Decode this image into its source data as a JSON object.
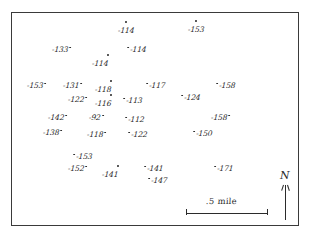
{
  "figure": {
    "background_color": "#ffffff",
    "ink_color": "#2b2b2b",
    "frame_color": "#3a3a3a"
  },
  "scale": {
    "label": ".5 mile",
    "bar_length_px": 82
  },
  "north_arrow": {
    "letter": "N"
  },
  "chart_data": {
    "type": "scatter",
    "xlabel": "",
    "ylabel": "",
    "grid": false,
    "legend": "none",
    "scale_bar": ".5 mile",
    "north_label": "N",
    "points": [
      {
        "label": "-114",
        "x": 118,
        "y": 26,
        "dot": "above-left"
      },
      {
        "label": "-153",
        "x": 188,
        "y": 25,
        "dot": "above-left"
      },
      {
        "label": "-133",
        "x": 52,
        "y": 45,
        "dot": "after"
      },
      {
        "label": "-114",
        "x": 126,
        "y": 45,
        "dot": "before"
      },
      {
        "label": "-114",
        "x": 92,
        "y": 59,
        "dot": "above-right"
      },
      {
        "label": "-153",
        "x": 27,
        "y": 81,
        "dot": "after"
      },
      {
        "label": "-131",
        "x": 63,
        "y": 81,
        "dot": "after"
      },
      {
        "label": "-118",
        "x": 95,
        "y": 85,
        "dot": "above-right"
      },
      {
        "label": "-117",
        "x": 145,
        "y": 81,
        "dot": "before"
      },
      {
        "label": "-158",
        "x": 215,
        "y": 81,
        "dot": "before"
      },
      {
        "label": "-124",
        "x": 180,
        "y": 93,
        "dot": "before"
      },
      {
        "label": "-122",
        "x": 68,
        "y": 95,
        "dot": "after"
      },
      {
        "label": "-116",
        "x": 95,
        "y": 99,
        "dot": "above-right"
      },
      {
        "label": "-113",
        "x": 122,
        "y": 96,
        "dot": "before"
      },
      {
        "label": "-142",
        "x": 48,
        "y": 113,
        "dot": "after"
      },
      {
        "label": "-92",
        "x": 89,
        "y": 113,
        "dot": "after"
      },
      {
        "label": "-112",
        "x": 124,
        "y": 115,
        "dot": "before"
      },
      {
        "label": "-158",
        "x": 211,
        "y": 113,
        "dot": "after"
      },
      {
        "label": "-138",
        "x": 43,
        "y": 128,
        "dot": "after"
      },
      {
        "label": "-118",
        "x": 87,
        "y": 130,
        "dot": "after"
      },
      {
        "label": "-122",
        "x": 127,
        "y": 130,
        "dot": "before"
      },
      {
        "label": "-150",
        "x": 192,
        "y": 129,
        "dot": "before"
      },
      {
        "label": "-153",
        "x": 72,
        "y": 152,
        "dot": "before"
      },
      {
        "label": "-152",
        "x": 68,
        "y": 164,
        "dot": "after"
      },
      {
        "label": "-141",
        "x": 102,
        "y": 170,
        "dot": "above-right"
      },
      {
        "label": "-141",
        "x": 143,
        "y": 164,
        "dot": "before"
      },
      {
        "label": "-147",
        "x": 147,
        "y": 176,
        "dot": "before"
      },
      {
        "label": "-171",
        "x": 213,
        "y": 164,
        "dot": "before"
      }
    ]
  }
}
